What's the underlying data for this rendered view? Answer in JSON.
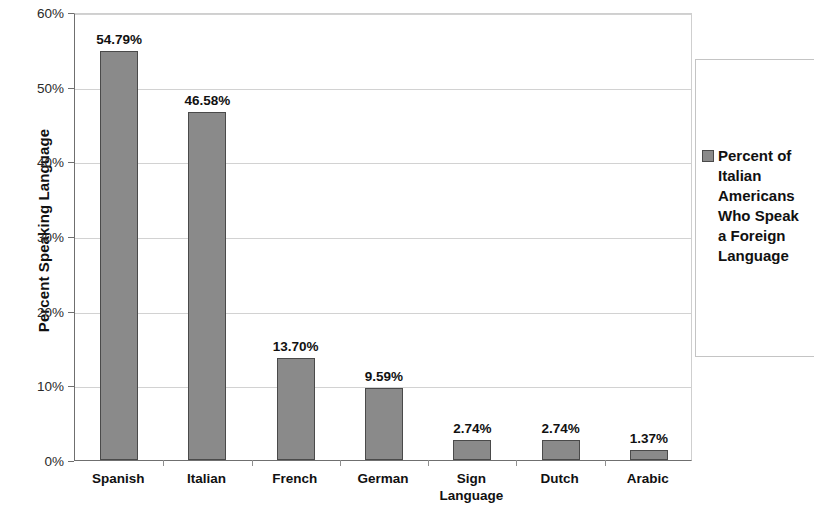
{
  "chart_data": {
    "type": "bar",
    "title": "",
    "xlabel": "",
    "ylabel": "Percent Speaking Language",
    "categories": [
      "Spanish",
      "Italian",
      "French",
      "German",
      "Sign Language",
      "Dutch",
      "Arabic"
    ],
    "values": [
      54.79,
      46.58,
      13.7,
      9.59,
      2.74,
      2.74,
      1.37
    ],
    "value_labels": [
      "54.79%",
      "46.58%",
      "13.70%",
      "9.59%",
      "2.74%",
      "2.74%",
      "1.37%"
    ],
    "ylim": [
      0,
      60
    ],
    "ytick_values": [
      0,
      10,
      20,
      30,
      40,
      50,
      60
    ],
    "ytick_labels": [
      "0%",
      "10%",
      "20%",
      "30%",
      "40%",
      "50%",
      "60%"
    ],
    "grid": true,
    "grid_axis": "y",
    "legend_position": "right",
    "series": [
      {
        "name": "Percent of Italian Americans Who Speak a Foreign Language",
        "name_wrapped": "Percent of\nItalian\nAmericans\nWho Speak\na Foreign\nLanguage",
        "color": "#8a8a8a",
        "border_color": "#4a4a4a",
        "values": [
          54.79,
          46.58,
          13.7,
          9.59,
          2.74,
          2.74,
          1.37
        ]
      }
    ],
    "colors": {
      "bar_fill": "#8a8a8a",
      "bar_border": "#4a4a4a",
      "gridline": "#d2d2d2",
      "axis": "#6f6f6f",
      "text": "#111111",
      "background": "#ffffff"
    }
  }
}
